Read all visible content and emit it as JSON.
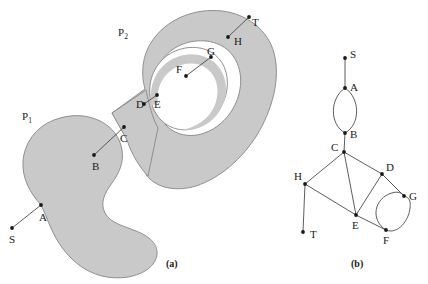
{
  "figure": {
    "background_color": "#ffffff",
    "polygon_fill": "#c9c9c9",
    "polygon_stroke": "#8a8a8a",
    "line_color": "#4a4a4a",
    "dot_color": "#1a1a1a",
    "text_color": "#1a1a1a"
  },
  "panel_a": {
    "caption": "(a)",
    "region_labels": [
      {
        "name": "obstacle-p1-label",
        "base": "P",
        "sub": "1",
        "x": 22,
        "y": 120
      },
      {
        "name": "obstacle-p2-label",
        "base": "P",
        "sub": "2",
        "x": 118,
        "y": 36
      }
    ],
    "nodes": [
      {
        "id": "S",
        "label": "S",
        "x": 12,
        "y": 228,
        "lx": 9,
        "ly": 243
      },
      {
        "id": "A",
        "label": "A",
        "x": 41,
        "y": 205,
        "lx": 39,
        "ly": 221
      },
      {
        "id": "B",
        "label": "B",
        "x": 94,
        "y": 155,
        "lx": 92,
        "ly": 170
      },
      {
        "id": "C",
        "label": "C",
        "x": 124,
        "y": 127,
        "lx": 120,
        "ly": 142
      },
      {
        "id": "D",
        "label": "D",
        "x": 144,
        "y": 104,
        "lx": 139,
        "ly": 106
      },
      {
        "id": "E",
        "label": "E",
        "x": 157,
        "y": 95,
        "lx": 155,
        "ly": 108
      },
      {
        "id": "F",
        "label": "F",
        "x": 186,
        "y": 76,
        "lx": 179,
        "ly": 70
      },
      {
        "id": "G",
        "label": "G",
        "x": 211,
        "y": 57,
        "lx": 208,
        "ly": 57
      },
      {
        "id": "H",
        "label": "H",
        "x": 228,
        "y": 37,
        "lx": 235,
        "ly": 44
      },
      {
        "id": "T",
        "label": "T",
        "x": 249,
        "y": 17,
        "lx": 251,
        "ly": 26
      }
    ],
    "edges": [
      {
        "from": "S",
        "to": "A"
      },
      {
        "from": "B",
        "to": "C"
      },
      {
        "from": "D",
        "to": "E"
      },
      {
        "from": "F",
        "to": "G"
      },
      {
        "from": "H",
        "to": "T"
      }
    ]
  },
  "panel_b": {
    "caption": "(b)",
    "nodes": [
      {
        "id": "S",
        "label": "S",
        "x": 345,
        "y": 58,
        "lx": 350,
        "ly": 58
      },
      {
        "id": "A",
        "label": "A",
        "x": 345,
        "y": 88,
        "lx": 350,
        "ly": 90
      },
      {
        "id": "B",
        "label": "B",
        "x": 345,
        "y": 133,
        "lx": 350,
        "ly": 137
      },
      {
        "id": "C",
        "label": "C",
        "x": 344,
        "y": 152,
        "lx": 332,
        "ly": 151
      },
      {
        "id": "D",
        "label": "D",
        "x": 382,
        "y": 174,
        "lx": 386,
        "ly": 171
      },
      {
        "id": "E",
        "label": "E",
        "x": 356,
        "y": 215,
        "lx": 353,
        "ly": 228
      },
      {
        "id": "F",
        "label": "F",
        "x": 386,
        "y": 230,
        "lx": 385,
        "ly": 243
      },
      {
        "id": "G",
        "label": "G",
        "x": 404,
        "y": 196,
        "lx": 409,
        "ly": 199
      },
      {
        "id": "H",
        "label": "H",
        "x": 305,
        "y": 184,
        "lx": 297,
        "ly": 179
      },
      {
        "id": "T",
        "label": "T",
        "x": 303,
        "y": 232,
        "lx": 309,
        "ly": 237
      }
    ],
    "edges": [
      {
        "from": "S",
        "to": "A",
        "type": "straight"
      },
      {
        "from": "A",
        "to": "B",
        "type": "arc-left"
      },
      {
        "from": "A",
        "to": "B",
        "type": "arc-right"
      },
      {
        "from": "B",
        "to": "C",
        "type": "straight"
      },
      {
        "from": "C",
        "to": "D",
        "type": "straight"
      },
      {
        "from": "C",
        "to": "E",
        "type": "straight"
      },
      {
        "from": "C",
        "to": "H",
        "type": "straight"
      },
      {
        "from": "D",
        "to": "E",
        "type": "straight"
      },
      {
        "from": "D",
        "to": "G",
        "type": "straight"
      },
      {
        "from": "E",
        "to": "F",
        "type": "straight"
      },
      {
        "from": "E",
        "to": "H",
        "type": "straight"
      },
      {
        "from": "F",
        "to": "G",
        "type": "arc-left"
      },
      {
        "from": "F",
        "to": "G",
        "type": "arc-right"
      },
      {
        "from": "H",
        "to": "T",
        "type": "straight"
      }
    ]
  }
}
